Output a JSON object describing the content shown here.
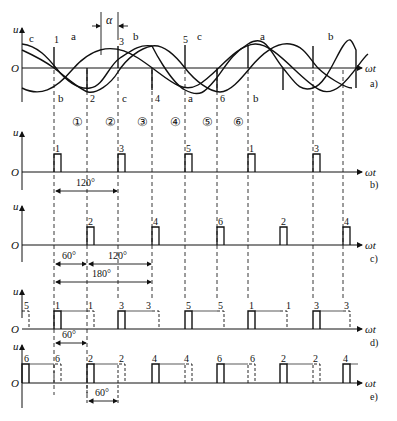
{
  "figure": {
    "axis_label_y": "u",
    "axis_label_x": "ωt",
    "origin_label": "O",
    "alpha_label": "α",
    "panel_labels": [
      "a)",
      "b)",
      "c)",
      "d)",
      "e)"
    ]
  },
  "panel_a": {
    "phase_labels_top": [
      "c",
      "a",
      "b",
      "c",
      "a",
      "b"
    ],
    "phase_labels_bottom": [
      "b",
      "c",
      "a",
      "b"
    ],
    "commutation_numbers_top": [
      "1",
      "3",
      "5"
    ],
    "commutation_numbers_bottom": [
      "2",
      "4",
      "6"
    ],
    "interval_labels": [
      "①",
      "②",
      "③",
      "④",
      "⑤",
      "⑥"
    ]
  },
  "panel_b": {
    "pulses": [
      "1",
      "3",
      "5",
      "1",
      "3"
    ],
    "angle": "120°"
  },
  "panel_c": {
    "pulses": [
      "2",
      "4",
      "6",
      "2",
      "4"
    ],
    "angle_60": "60°",
    "angle_120": "120°",
    "angle_180": "180°"
  },
  "panel_d": {
    "labels": [
      "5",
      "1",
      "1",
      "3",
      "3",
      "5",
      "5",
      "1",
      "1",
      "3",
      "3"
    ],
    "angle": "60°"
  },
  "panel_e": {
    "labels": [
      "6",
      "6",
      "2",
      "2",
      "4",
      "4",
      "6",
      "6",
      "2",
      "2",
      "4"
    ],
    "angle": "60°"
  }
}
